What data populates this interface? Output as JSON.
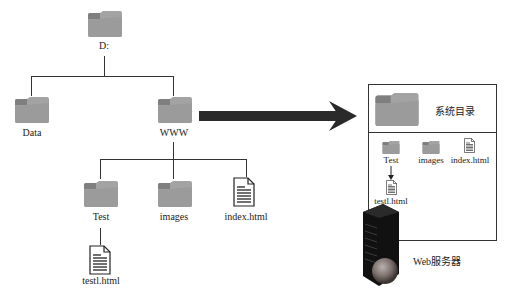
{
  "tree": {
    "root": {
      "label": "D:"
    },
    "level1": [
      {
        "label": "Data"
      },
      {
        "label": "WWW"
      }
    ],
    "level2": [
      {
        "label": "Test"
      },
      {
        "label": "images"
      },
      {
        "label": "index.html"
      }
    ],
    "level3": [
      {
        "label": "testl.html"
      }
    ]
  },
  "server_box": {
    "title": "系统目录",
    "items": [
      {
        "label": "Test"
      },
      {
        "label": "images"
      },
      {
        "label": "index.html"
      }
    ],
    "sub_item": {
      "label": "testl.html"
    },
    "server_label": "Web服务器"
  },
  "icons": {
    "folder": "folder-icon",
    "file": "html-file-icon",
    "server": "server-icon",
    "arrow": "arrow-right-icon"
  },
  "colors": {
    "folder": "#9e9e9e",
    "folder_tab": "#7d7d7d",
    "line": "#333333",
    "arrow": "#2a2a2a"
  }
}
